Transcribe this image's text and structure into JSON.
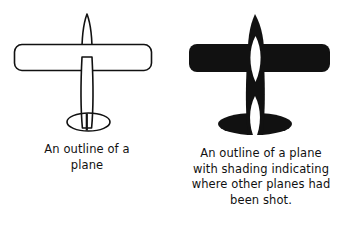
{
  "figure": {
    "background_color": "#ffffff",
    "ink_color": "#111111",
    "panels": [
      {
        "id": "outline-plane",
        "diagram_name": "plane-outline-unshaded",
        "fill_style": "outline",
        "shading_regions": [],
        "caption_lines": [
          "An outline of a",
          "plane"
        ]
      },
      {
        "id": "shaded-plane",
        "diagram_name": "plane-outline-shaded",
        "fill_style": "solid-black-with-white-regions",
        "shading_regions": [
          "wing-root-fuselage-ellipse",
          "tail-fuselage-ellipse"
        ],
        "caption_lines": [
          "An outline of a plane",
          "with shading indicating",
          "where other planes had",
          "been shot."
        ]
      }
    ]
  }
}
